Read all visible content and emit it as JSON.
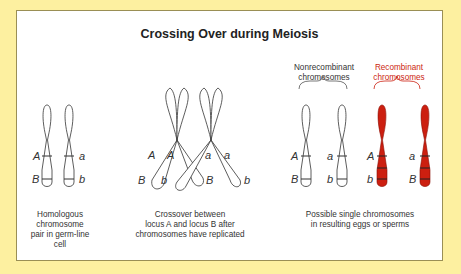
{
  "title": "Crossing Over during Meiosis",
  "colors": {
    "background": "#fdf0a0",
    "panel": "#ffffff",
    "border": "#9a8f55",
    "recombinant": "#cc1f10",
    "text": "#333333"
  },
  "groups": {
    "nonrecombinant_label": "Nonrecombinant chromosomes",
    "recombinant_label": "Recombinant chromosomes"
  },
  "panels": [
    {
      "caption": "Homologous chromosome pair in germ-line cell",
      "chromosomes": [
        {
          "upper": "A",
          "lower": "B"
        },
        {
          "upper": "a",
          "lower": "b"
        }
      ]
    },
    {
      "caption": "Crossover between locus A and locus B after chromosomes have replicated",
      "labels": [
        "A",
        "A",
        "a",
        "a",
        "B",
        "b",
        "B",
        "b"
      ]
    },
    {
      "caption": "Possible single chromosomes in resulting eggs or sperms",
      "chromosomes": [
        {
          "upper": "A",
          "lower": "B",
          "type": "nonrecombinant"
        },
        {
          "upper": "a",
          "lower": "b",
          "type": "nonrecombinant"
        },
        {
          "upper": "A",
          "lower": "b",
          "type": "recombinant"
        },
        {
          "upper": "a",
          "lower": "B",
          "type": "recombinant"
        }
      ]
    }
  ],
  "captions": {
    "c1": [
      "Homologous",
      "chromosome",
      "pair in germ-line",
      "cell"
    ],
    "c2": [
      "Crossover between",
      "locus A and locus B after",
      "chromosomes have replicated"
    ],
    "c3": [
      "Possible single chromosomes",
      "in resulting eggs or sperms"
    ]
  },
  "headers": {
    "nonrec": [
      "Nonrecombinant",
      "chromosomes"
    ],
    "rec": [
      "Recombinant",
      "chromosomes"
    ]
  }
}
